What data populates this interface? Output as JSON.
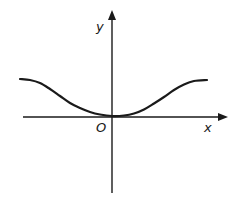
{
  "diagram": {
    "type": "function-graph",
    "colors": {
      "background": "#ffffff",
      "ink": "#1a1a1a"
    },
    "labels": {
      "y_axis": "y",
      "x_axis": "x",
      "origin": "O"
    },
    "axes": {
      "x_axis": {
        "x1": 23,
        "y1": 117,
        "x2": 218,
        "y2": 117,
        "arrow_tip": [
          226,
          117
        ]
      },
      "y_axis": {
        "x1": 112,
        "y1": 193,
        "x2": 112,
        "y2": 20,
        "arrow_tip": [
          112,
          12
        ]
      }
    },
    "label_positions": {
      "y_axis": [
        96,
        31
      ],
      "x_axis": [
        204,
        132
      ],
      "origin": [
        96,
        132
      ]
    },
    "curve": {
      "points": [
        [
          20,
          79
        ],
        [
          30,
          80
        ],
        [
          40,
          83
        ],
        [
          50,
          89
        ],
        [
          60,
          96
        ],
        [
          70,
          103
        ],
        [
          80,
          108
        ],
        [
          90,
          112
        ],
        [
          100,
          114.5
        ],
        [
          112,
          116
        ],
        [
          124,
          115.5
        ],
        [
          134,
          113.5
        ],
        [
          144,
          109.5
        ],
        [
          154,
          103.5
        ],
        [
          164,
          97
        ],
        [
          174,
          90
        ],
        [
          184,
          84.5
        ],
        [
          194,
          81
        ],
        [
          207,
          80
        ]
      ]
    }
  }
}
